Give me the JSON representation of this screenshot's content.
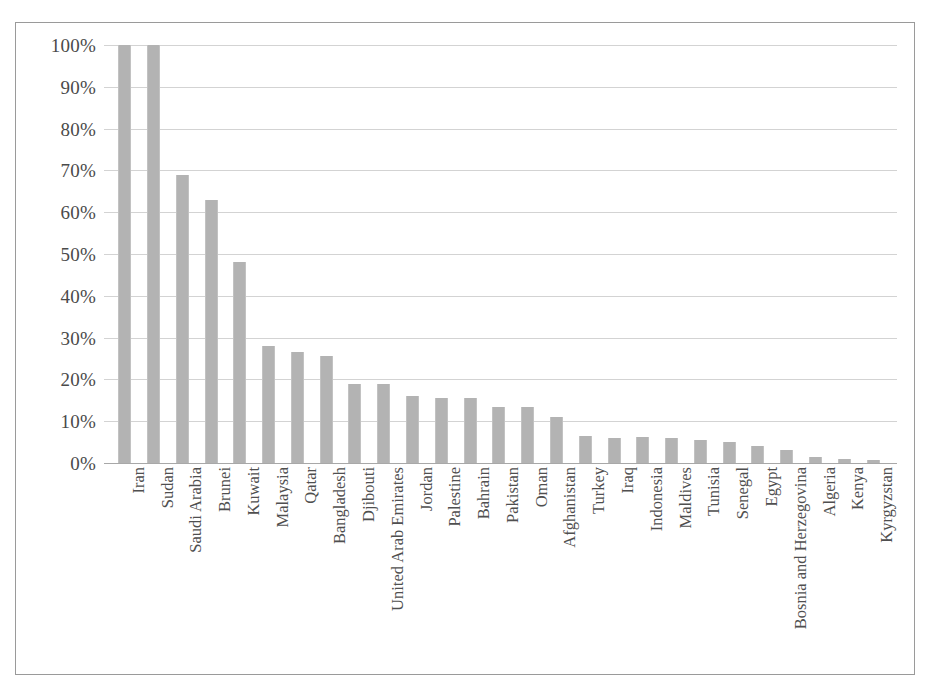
{
  "chart_data": {
    "type": "bar",
    "title": "",
    "subtitle": "",
    "xlabel": "",
    "ylabel": "",
    "ylim": [
      0,
      100
    ],
    "ytick_labels": [
      "100%",
      "90%",
      "80%",
      "70%",
      "60%",
      "50%",
      "40%",
      "30%",
      "20%",
      "10%",
      "0%"
    ],
    "ytick_values": [
      100,
      90,
      80,
      70,
      60,
      50,
      40,
      30,
      20,
      10,
      0
    ],
    "grid": "horizontal",
    "legend": "none",
    "value_unit": "percent",
    "bar_color": "#b3b3b3",
    "gridline_color": "#d3d3d3",
    "axis_color": "#a8a8a8",
    "border_color": "#9a9a9a",
    "categories": [
      "Iran",
      "Sudan",
      "Saudi Arabia",
      "Brunei",
      "Kuwait",
      "Malaysia",
      "Qatar",
      "Bangladesh",
      "Djibouti",
      "United Arab Emirates",
      "Jordan",
      "Palestine",
      "Bahrain",
      "Pakistan",
      "Oman",
      "Afghanistan",
      "Turkey",
      "Iraq",
      "Indonesia",
      "Maldives",
      "Tunisia",
      "Senegal",
      "Egypt",
      "Bosnia and Herzegovina",
      "Algeria",
      "Kenya",
      "Kyrgyzstan"
    ],
    "values": [
      100,
      100,
      69,
      63,
      48,
      28,
      26.5,
      25.5,
      19,
      19,
      16,
      15.5,
      15.5,
      13.5,
      13.5,
      11,
      6.5,
      6,
      6.3,
      6,
      5.5,
      5,
      4,
      3,
      1.5,
      1,
      0.8
    ]
  }
}
